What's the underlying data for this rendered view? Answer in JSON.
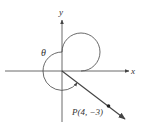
{
  "diagram": {
    "type": "angle-in-standard-position",
    "axes": {
      "x_label": "x",
      "y_label": "y"
    },
    "angle_label": "θ",
    "point": {
      "name": "P",
      "x": 4,
      "y": -3,
      "label": "P(4, −3)"
    },
    "colors": {
      "line": "#444444",
      "text": "#333333",
      "background": "#ffffff"
    }
  }
}
